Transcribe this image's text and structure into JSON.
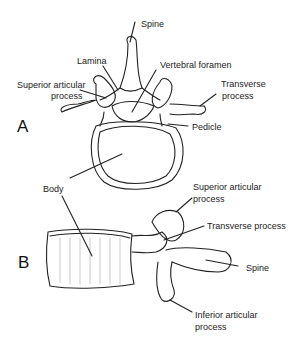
{
  "figure_a": {
    "letter": "A",
    "labels": {
      "spine": "Spine",
      "lamina": "Lamina",
      "vertebral_foramen": "Vertebral foramen",
      "superior_articular_1": "Superior articular",
      "superior_articular_2": "process",
      "transverse_1": "Transverse",
      "transverse_2": "process",
      "pedicle": "Pedicle",
      "body": "Body"
    }
  },
  "figure_b": {
    "letter": "B",
    "labels": {
      "superior_articular_1": "Superior articular",
      "superior_articular_2": "process",
      "transverse": "Transverse process",
      "spine": "Spine",
      "inferior_articular_1": "Inferior articular",
      "inferior_articular_2": "process"
    }
  }
}
